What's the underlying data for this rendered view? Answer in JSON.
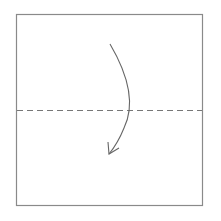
{
  "diagram": {
    "type": "origami-fold-step",
    "paper": {
      "shape": "square",
      "stroke": "#8a8a8a",
      "fill": "#ffffff"
    },
    "fold_line": {
      "style": "valley-fold-dashed",
      "orientation": "horizontal",
      "position": "middle",
      "stroke": "#777777"
    },
    "arrow": {
      "direction": "top-to-bottom",
      "meaning": "fold top half down",
      "stroke": "#666666"
    }
  }
}
